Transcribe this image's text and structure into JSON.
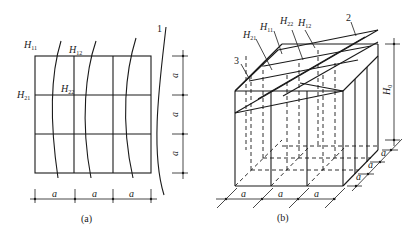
{
  "figure": {
    "panel_a": {
      "caption": "(a)",
      "labels": {
        "H11": {
          "main": "H",
          "sub": "11"
        },
        "H12": {
          "main": "H",
          "sub": "12"
        },
        "H21": {
          "main": "H",
          "sub": "21"
        },
        "H22": {
          "main": "H",
          "sub": "22"
        },
        "callout_1": "1"
      },
      "dimensions": {
        "bottom": [
          "a",
          "a",
          "a"
        ],
        "right": [
          "a",
          "a",
          "a"
        ]
      }
    },
    "panel_b": {
      "caption": "(b)",
      "labels": {
        "H21": {
          "main": "H",
          "sub": "21"
        },
        "H11": {
          "main": "H",
          "sub": "11"
        },
        "H22": {
          "main": "H",
          "sub": "22"
        },
        "H12": {
          "main": "H",
          "sub": "12"
        },
        "callout_2": "2",
        "callout_3": "3",
        "height": {
          "main": "H",
          "sub": "0"
        }
      },
      "dimensions": {
        "bottom": [
          "a",
          "a",
          "a"
        ],
        "depth": [
          "a",
          "a",
          "a"
        ]
      }
    }
  }
}
